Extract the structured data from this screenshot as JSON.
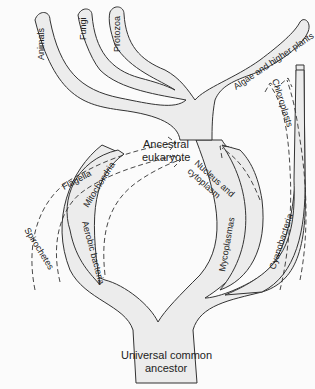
{
  "diagram": {
    "type": "tree-of-life-endosymbiosis",
    "nodes": {
      "root": {
        "line1": "Universal common",
        "line2": "ancestor"
      },
      "ancestral_eukaryote": {
        "line1": "Ancestral",
        "line2": "eukaryote"
      }
    },
    "branches": {
      "animals": "Animals",
      "fungi": "Fungi",
      "protozoa": "Protozoa",
      "algae": "Algae and higher plants",
      "spirochetes": "Spirochetes",
      "aerobic_bacteria": "Aerobic bacteria",
      "mycoplasmas": "Mycoplasmas",
      "cyanobacteria": "Cyanobacteria"
    },
    "transfers": {
      "flagella": "Flagella",
      "mitochondria": "Mitochondria",
      "nucleus": "Nucleus and cytoplasm",
      "nucleus_line1": "Nucleus and",
      "nucleus_line2": "cytoplasm",
      "chloroplasts": "Chloroplasts"
    },
    "colors": {
      "fill": "#ececec",
      "stroke": "#333333",
      "background": "#fbfbfb"
    }
  }
}
